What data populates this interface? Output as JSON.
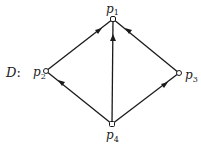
{
  "diagram": {
    "name": "D",
    "name_suffix": ":",
    "nodes": [
      {
        "id": "p1",
        "base": "p",
        "sub": "1",
        "x": 113,
        "y": 19
      },
      {
        "id": "p2",
        "base": "p",
        "sub": "2",
        "x": 46,
        "y": 71
      },
      {
        "id": "p3",
        "base": "p",
        "sub": "3",
        "x": 179,
        "y": 73
      },
      {
        "id": "p4",
        "base": "p",
        "sub": "4",
        "x": 112,
        "y": 124
      }
    ],
    "edges": [
      {
        "from": "p2",
        "to": "p1"
      },
      {
        "from": "p4",
        "to": "p1"
      },
      {
        "from": "p3",
        "to": "p1"
      },
      {
        "from": "p4",
        "to": "p2"
      },
      {
        "from": "p4",
        "to": "p3"
      }
    ],
    "colors": {
      "stroke": "#1a1a1a",
      "node_fill": "#ffffff"
    }
  }
}
